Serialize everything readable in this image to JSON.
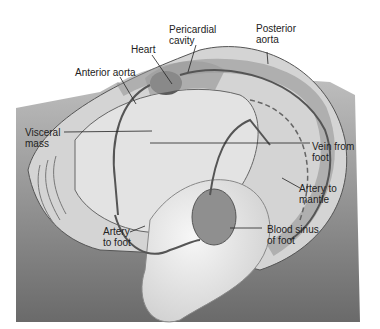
{
  "diagram": {
    "labels": {
      "heart": "Heart",
      "pericardial_cavity": "Pericardial\ncavity",
      "posterior_aorta": "Posterior\naorta",
      "anterior_aorta": "Anterior aorta",
      "visceral_mass": "Visceral\nmass",
      "vein_from_foot": "Vein from\nfoot",
      "artery_to_mantle": "Artery to\nmantle",
      "artery_to_foot": "Artery\nto foot",
      "blood_sinus_of_foot": "Blood sinus\nof foot"
    },
    "colors": {
      "background_dark": "#6e6e6e",
      "background_light": "#bdbdbd",
      "shell": "#d9d9d9",
      "body": "#ececec",
      "vessel": "#555555",
      "heart": "#5a5a5a"
    }
  }
}
